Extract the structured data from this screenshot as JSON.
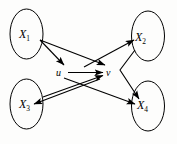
{
  "figure": {
    "type": "directed-graph-diagram",
    "background_color": "#fdfdfc",
    "stroke_color": "#000000",
    "nodes": [
      {
        "id": "X1",
        "label_base": "X",
        "label_sub": "1",
        "shape": "ellipse",
        "cx": 26.5,
        "cy": 34,
        "rx": 16.5,
        "ry": 25
      },
      {
        "id": "X2",
        "label_base": "X",
        "label_sub": "2",
        "shape": "ellipse",
        "cx": 148,
        "cy": 36,
        "rx": 16.5,
        "ry": 25
      },
      {
        "id": "X3",
        "label_base": "X",
        "label_sub": "3",
        "shape": "ellipse",
        "cx": 26.5,
        "cy": 104,
        "rx": 16.5,
        "ry": 25
      },
      {
        "id": "X4",
        "label_base": "X",
        "label_sub": "4",
        "shape": "ellipse",
        "cx": 148,
        "cy": 106,
        "rx": 16.5,
        "ry": 25
      },
      {
        "id": "u",
        "label_base": "u",
        "label_sub": "",
        "shape": "point",
        "cx": 60,
        "cy": 72
      },
      {
        "id": "v",
        "label_base": "v",
        "label_sub": "",
        "shape": "point",
        "cx": 110,
        "cy": 72
      }
    ],
    "edges": [
      {
        "from": "X1",
        "to": "u",
        "arrowhead": true
      },
      {
        "from": "X1",
        "to": "v",
        "arrowhead": true
      },
      {
        "from": "X3",
        "to": "v",
        "arrowhead": true
      },
      {
        "from": "u",
        "to": "v",
        "arrowhead": true
      },
      {
        "from": "u",
        "to": "X4",
        "arrowhead": true
      },
      {
        "from": "v",
        "to": "X2",
        "arrowhead": true
      },
      {
        "from": "v",
        "to": "X3",
        "arrowhead": true
      },
      {
        "from": "X2",
        "to": "X4",
        "arrowhead": true,
        "bent": true
      }
    ]
  }
}
